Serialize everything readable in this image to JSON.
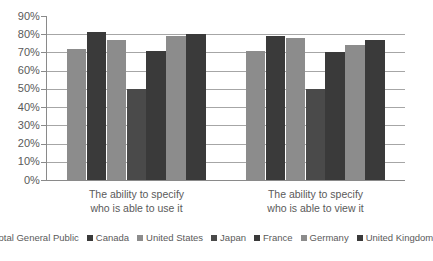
{
  "chart_data": {
    "type": "bar",
    "title": "",
    "subtitle": "",
    "xlabel": "",
    "ylabel": "",
    "ylim": [
      0,
      90
    ],
    "grid": true,
    "legend_position": "bottom",
    "categories": [
      "The ability to specify who is able to use it",
      "The ability to specify who is able to view it"
    ],
    "category_lines": [
      [
        "The ability to specify",
        "who is able to use it"
      ],
      [
        "The ability to specify",
        "who is able to view it"
      ]
    ],
    "ytick_labels": [
      "90%",
      "80%",
      "70%",
      "60%",
      "50%",
      "40%",
      "30%",
      "20%",
      "10%",
      "0%"
    ],
    "ytick_values": [
      90,
      80,
      70,
      60,
      50,
      40,
      30,
      20,
      10,
      0
    ],
    "series": [
      {
        "name": "Total General Public",
        "color": "#8c8c8c",
        "values": [
          72,
          71
        ]
      },
      {
        "name": "Canada",
        "color": "#3a3a3a",
        "values": [
          81,
          79
        ]
      },
      {
        "name": "United States",
        "color": "#8c8c8c",
        "values": [
          77,
          78
        ]
      },
      {
        "name": "Japan",
        "color": "#4a4a4a",
        "values": [
          50,
          50
        ]
      },
      {
        "name": "France",
        "color": "#3a3a3a",
        "values": [
          71,
          70
        ]
      },
      {
        "name": "Germany",
        "color": "#8c8c8c",
        "values": [
          79,
          74
        ]
      },
      {
        "name": "United Kingdom",
        "color": "#3a3a3a",
        "values": [
          80,
          77
        ]
      }
    ]
  }
}
